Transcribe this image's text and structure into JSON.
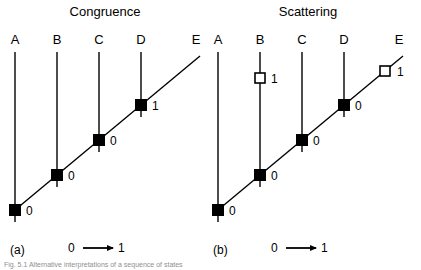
{
  "figure": {
    "width": 421,
    "height": 270,
    "background": "#ffffff",
    "line_color": "#000000",
    "marker_fill_closed": "#000000",
    "marker_fill_open": "#ffffff"
  },
  "caption": {
    "text": "Fig. 5.1  Alternative interpretations of a sequence of states",
    "visible": "partially-cropped"
  },
  "panels": [
    {
      "id": "a",
      "title": "Congruence",
      "tag": "(a)",
      "title_x": 105,
      "title_y": 16,
      "tag_x": 10,
      "tag_y": 254,
      "origin_x": 15,
      "nodes": [
        {
          "label": "A",
          "x": 15,
          "label_y": 44,
          "line_top": 52,
          "line_bottom": 222
        },
        {
          "label": "B",
          "x": 57,
          "label_y": 44,
          "line_top": 52,
          "line_bottom": 187
        },
        {
          "label": "C",
          "x": 99,
          "label_y": 44,
          "line_top": 52,
          "line_bottom": 152
        },
        {
          "label": "D",
          "x": 141,
          "label_y": 44,
          "line_top": 52,
          "line_bottom": 117
        },
        {
          "label": "E",
          "x": 196,
          "label_y": 44,
          "line_top": null,
          "line_bottom": null
        }
      ],
      "diagonal": {
        "x1": 15,
        "y1": 210,
        "x2": 200,
        "y2": 56
      },
      "markers": [
        {
          "node": "A",
          "x": 15,
          "y": 210,
          "type": "closed",
          "value": "0",
          "label_dx": 11,
          "label_dy": 5
        },
        {
          "node": "B",
          "x": 57,
          "y": 175,
          "type": "closed",
          "value": "0",
          "label_dx": 11,
          "label_dy": 5
        },
        {
          "node": "C",
          "x": 99,
          "y": 140,
          "type": "closed",
          "value": "0",
          "label_dx": 11,
          "label_dy": 5
        },
        {
          "node": "D",
          "x": 141,
          "y": 105,
          "type": "closed",
          "value": "1",
          "label_dx": 11,
          "label_dy": 5
        }
      ],
      "legend": {
        "from": "0",
        "to": "1",
        "x": 68,
        "y": 252,
        "arrow_x1": 83,
        "arrow_x2": 113
      }
    },
    {
      "id": "b",
      "title": "Scattering",
      "tag": "(b)",
      "title_x": 308,
      "title_y": 16,
      "tag_x": 213,
      "tag_y": 254,
      "origin_x": 218,
      "nodes": [
        {
          "label": "A",
          "x": 218,
          "label_y": 44,
          "line_top": 52,
          "line_bottom": 222
        },
        {
          "label": "B",
          "x": 260,
          "label_y": 44,
          "line_top": 52,
          "line_bottom": 187
        },
        {
          "label": "C",
          "x": 302,
          "label_y": 44,
          "line_top": 52,
          "line_bottom": 152
        },
        {
          "label": "D",
          "x": 344,
          "label_y": 44,
          "line_top": 52,
          "line_bottom": 117
        },
        {
          "label": "E",
          "x": 399,
          "label_y": 44,
          "line_top": null,
          "line_bottom": null
        }
      ],
      "diagonal": {
        "x1": 218,
        "y1": 210,
        "x2": 403,
        "y2": 56
      },
      "markers": [
        {
          "node": "A",
          "x": 218,
          "y": 210,
          "type": "closed",
          "value": "0",
          "label_dx": 11,
          "label_dy": 5
        },
        {
          "node": "B",
          "x": 260,
          "y": 175,
          "type": "closed",
          "value": "0",
          "label_dx": 11,
          "label_dy": 5
        },
        {
          "node": "C",
          "x": 302,
          "y": 140,
          "type": "closed",
          "value": "0",
          "label_dx": 11,
          "label_dy": 5
        },
        {
          "node": "D",
          "x": 344,
          "y": 105,
          "type": "closed",
          "value": "0",
          "label_dx": 11,
          "label_dy": 5
        },
        {
          "node": "B",
          "x": 260,
          "y": 78,
          "type": "open",
          "value": "1",
          "label_dx": 11,
          "label_dy": 5
        },
        {
          "node": "E",
          "x": 385,
          "y": 71,
          "type": "open",
          "value": "1",
          "label_dx": 12,
          "label_dy": 5
        }
      ],
      "legend": {
        "from": "0",
        "to": "1",
        "x": 271,
        "y": 252,
        "arrow_x1": 286,
        "arrow_x2": 316
      }
    }
  ]
}
